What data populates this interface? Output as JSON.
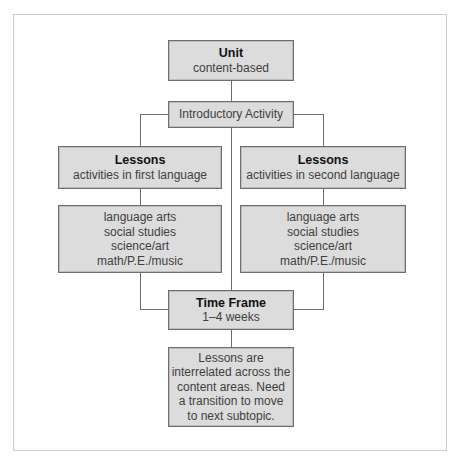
{
  "diagram": {
    "unit": {
      "title": "Unit",
      "subtitle": "content-based"
    },
    "introductory": {
      "label": "Introductory Activity"
    },
    "lessons_left": {
      "title": "Lessons",
      "subtitle": "activities in first language"
    },
    "lessons_right": {
      "title": "Lessons",
      "subtitle": "activities in second language"
    },
    "subjects_left": {
      "lines": [
        "language arts",
        "social studies",
        "science/art",
        "math/P.E./music"
      ]
    },
    "subjects_right": {
      "lines": [
        "language arts",
        "social studies",
        "science/art",
        "math/P.E./music"
      ]
    },
    "time_frame": {
      "title": "Time Frame",
      "subtitle": "1–4 weeks"
    },
    "note": {
      "lines": [
        "Lessons are",
        "interrelated across the",
        "content areas. Need",
        "a transition to move",
        "to next subtopic."
      ]
    }
  },
  "colors": {
    "box_fill": "#dcdcdc",
    "box_border": "#6e6e6e",
    "line": "#6e6e6e",
    "frame": "#cfcfcf"
  }
}
